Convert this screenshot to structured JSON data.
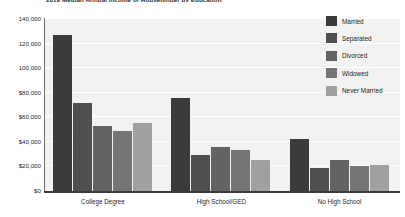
{
  "chart_data": {
    "type": "bar",
    "title": "2019 Median Annual Income of Householder by Education",
    "xlabel": "",
    "ylabel": "",
    "categories": [
      "College Degree",
      "High School/GED",
      "No High School"
    ],
    "series": [
      {
        "name": "Married",
        "color": "#3b3b3b",
        "values": [
          127000,
          76000,
          42000
        ]
      },
      {
        "name": "Separated",
        "color": "#4f4f4f",
        "values": [
          72000,
          29000,
          19000
        ]
      },
      {
        "name": "Divorced",
        "color": "#636363",
        "values": [
          53000,
          36000,
          25000
        ]
      },
      {
        "name": "Widowed",
        "color": "#757575",
        "values": [
          49000,
          33000,
          20000
        ]
      },
      {
        "name": "Never Married",
        "color": "#a0a0a0",
        "values": [
          55000,
          25000,
          21000
        ]
      }
    ],
    "ylim": [
      0,
      140000
    ],
    "yticks": [
      0,
      20000,
      40000,
      60000,
      80000,
      100000,
      120000,
      140000
    ],
    "ytick_labels": [
      "$0",
      "$20,000",
      "$40,000",
      "$60,000",
      "$80,000",
      "100,000",
      "120,000",
      "140,000"
    ],
    "grid": true,
    "legend_position": "right",
    "plot_background": "#f2f2f2",
    "gridline_color": "#ffffff",
    "axis_color": "#3a3a3a"
  }
}
